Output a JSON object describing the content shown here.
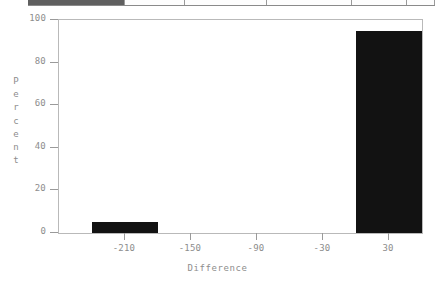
{
  "top_bar": {
    "name": "cut-off-toolbar-row",
    "visible_fragment": true,
    "cells": [
      {
        "shade": "dark",
        "width": 97
      },
      {
        "shade": "light",
        "width": 60
      },
      {
        "shade": "light",
        "width": 82
      },
      {
        "shade": "light",
        "width": 85
      },
      {
        "shade": "light",
        "width": 55
      },
      {
        "shade": "light",
        "width": 28
      }
    ]
  },
  "chart_data": {
    "type": "bar",
    "title": "",
    "subtitle": "",
    "xlabel": "Difference",
    "ylabel": "Percent",
    "ylabel_letters": [
      "P",
      "e",
      "r",
      "c",
      "e",
      "n",
      "t"
    ],
    "categories": [
      "-210",
      "30"
    ],
    "values": [
      5,
      95
    ],
    "bars": [
      {
        "center": -210,
        "bin_start": -240,
        "bin_end": -180,
        "value": 5
      },
      {
        "center": 30,
        "bin_start": 0,
        "bin_end": 60,
        "value": 95
      }
    ],
    "xlim": [
      -270,
      60
    ],
    "ylim": [
      0,
      100
    ],
    "xticks": [
      -210,
      -150,
      -90,
      -30,
      30
    ],
    "xtick_labels": [
      "-210",
      "-150",
      "-90",
      "-30",
      "30"
    ],
    "yticks": [
      0,
      20,
      40,
      60,
      80,
      100
    ],
    "ytick_labels": [
      "0",
      "20",
      "40",
      "60",
      "80",
      "100"
    ],
    "grid": false,
    "legend": null,
    "bar_color": "#121212",
    "axis_color": "#9a9a9a",
    "frame_color": "#b9b9b9",
    "text_color": "#8d8d8d",
    "background": "#ffffff"
  }
}
